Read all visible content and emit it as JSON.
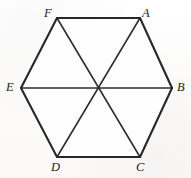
{
  "figure": {
    "shape": "hexagon",
    "background_color": "#fdfdfc",
    "stroke_color": "#2b2b2b",
    "label_color": "#1b1b1b",
    "outline_stroke_width": 2.0,
    "diagonal_stroke_width": 1.5,
    "center": {
      "x": 96.5,
      "y": 87.5
    },
    "vertices": [
      {
        "id": "A",
        "label": "A",
        "x": 140,
        "y": 18,
        "label_x": 142,
        "label_y": 8,
        "position": "top-right"
      },
      {
        "id": "B",
        "label": "B",
        "x": 172,
        "y": 88,
        "label_x": 176,
        "label_y": 82,
        "position": "right"
      },
      {
        "id": "C",
        "label": "C",
        "x": 140,
        "y": 157,
        "label_x": 137,
        "label_y": 162,
        "position": "bottom-right"
      },
      {
        "id": "D",
        "label": "D",
        "x": 57,
        "y": 157,
        "label_x": 52,
        "label_y": 162,
        "position": "bottom-left"
      },
      {
        "id": "E",
        "label": "E",
        "x": 21,
        "y": 88,
        "label_x": 7,
        "label_y": 82,
        "position": "left"
      },
      {
        "id": "F",
        "label": "F",
        "x": 57,
        "y": 18,
        "label_x": 45,
        "label_y": 8,
        "position": "top-left"
      }
    ],
    "outline_edges": [
      {
        "id": "edge-FA",
        "from": "F",
        "to": "A"
      },
      {
        "id": "edge-AB",
        "from": "A",
        "to": "B"
      },
      {
        "id": "edge-BC",
        "from": "B",
        "to": "C"
      },
      {
        "id": "edge-CD",
        "from": "C",
        "to": "D"
      },
      {
        "id": "edge-DE",
        "from": "D",
        "to": "E"
      },
      {
        "id": "edge-EF",
        "from": "E",
        "to": "F"
      }
    ],
    "diagonals": [
      {
        "id": "diagonal-AD",
        "from": "A",
        "to": "D"
      },
      {
        "id": "diagonal-BE",
        "from": "B",
        "to": "E"
      },
      {
        "id": "diagonal-CF",
        "from": "C",
        "to": "F"
      }
    ]
  }
}
